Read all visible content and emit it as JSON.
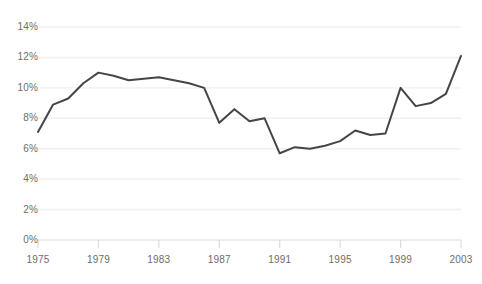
{
  "chart_data": {
    "type": "line",
    "title": "",
    "subtitle": "",
    "xlabel": "",
    "ylabel": "",
    "legend": [],
    "legend_position": "none",
    "grid": true,
    "grid_axis": "y",
    "line_color": "#44444a",
    "line_width": 2,
    "background_color": "#ffffff",
    "gridline_color": "#f0f0f0",
    "axis_color": "#dcdcdc",
    "tick_label_color": "#6d6d6d",
    "xlim": [
      1975,
      2003
    ],
    "ylim": [
      0,
      14
    ],
    "y_tick_labels": [
      "14%",
      "12%",
      "10%",
      "8%",
      "6%",
      "4%",
      "2%",
      "0%"
    ],
    "y_ticks": [
      14,
      12,
      10,
      8,
      6,
      4,
      2,
      0
    ],
    "x_tick_labels": [
      "1975",
      "1979",
      "1983",
      "1987",
      "1991",
      "1995",
      "1999",
      "2003"
    ],
    "x_ticks": [
      1975,
      1979,
      1983,
      1987,
      1991,
      1995,
      1999,
      2003
    ],
    "y_unit": "%",
    "x": [
      1975,
      1976,
      1977,
      1978,
      1979,
      1980,
      1981,
      1982,
      1983,
      1984,
      1985,
      1986,
      1987,
      1988,
      1989,
      1990,
      1991,
      1992,
      1993,
      1994,
      1995,
      1996,
      1997,
      1998,
      1999,
      2000,
      2001,
      2002,
      2003
    ],
    "values": [
      7.1,
      8.9,
      9.3,
      10.3,
      11.0,
      10.8,
      10.5,
      10.6,
      10.7,
      10.5,
      10.3,
      10.0,
      7.7,
      8.6,
      7.8,
      8.0,
      5.7,
      6.1,
      6.0,
      6.2,
      6.5,
      7.2,
      6.9,
      7.0,
      10.0,
      8.8,
      9.0,
      9.6,
      12.1
    ],
    "series": [
      {
        "name": "series-1",
        "values": [
          7.1,
          8.9,
          9.3,
          10.3,
          11.0,
          10.8,
          10.5,
          10.6,
          10.7,
          10.5,
          10.3,
          10.0,
          7.7,
          8.6,
          7.8,
          8.0,
          5.7,
          6.1,
          6.0,
          6.2,
          6.5,
          7.2,
          6.9,
          7.0,
          10.0,
          8.8,
          9.0,
          9.6,
          12.1
        ]
      }
    ]
  }
}
